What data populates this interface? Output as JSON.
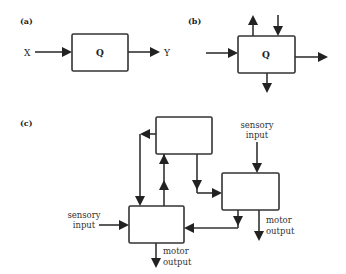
{
  "panels": {
    "a": {
      "label": "(a)",
      "input_label": "X",
      "output_label": "Y",
      "box_label": "Q"
    },
    "b": {
      "label": "(b)",
      "box_label": "Q"
    },
    "c": {
      "label": "(c)",
      "left_box": {
        "input_label_line1": "sensory",
        "input_label_line2": "input",
        "output_label_line1": "motor",
        "output_label_line2": "output"
      },
      "right_box": {
        "input_label_line1": "sensory",
        "input_label_line2": "input",
        "output_label_line1": "motor",
        "output_label_line2": "output"
      }
    }
  },
  "colors": {
    "stroke": "#333333",
    "background": "#ffffff"
  }
}
